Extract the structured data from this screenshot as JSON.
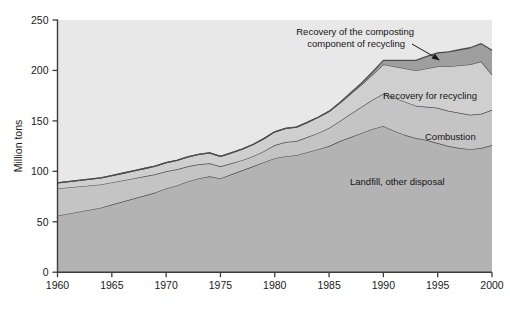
{
  "chart_data": {
    "type": "area",
    "title": "",
    "xlabel": "",
    "ylabel": "Million tons",
    "xlim": [
      1960,
      2000
    ],
    "ylim": [
      0,
      250
    ],
    "grid": false,
    "legend_position": "inline-annotations",
    "stacked": true,
    "x_ticks": [
      "1960",
      "1965",
      "1970",
      "1975",
      "1980",
      "1985",
      "1990",
      "1995",
      "2000"
    ],
    "y_ticks": [
      "0",
      "50",
      "100",
      "150",
      "200",
      "250"
    ],
    "x": [
      1960,
      1961,
      1962,
      1963,
      1964,
      1965,
      1966,
      1967,
      1968,
      1969,
      1970,
      1971,
      1972,
      1973,
      1974,
      1975,
      1976,
      1977,
      1978,
      1979,
      1980,
      1981,
      1982,
      1983,
      1984,
      1985,
      1986,
      1987,
      1988,
      1989,
      1990,
      1991,
      1992,
      1993,
      1994,
      1995,
      1996,
      1997,
      1998,
      1999,
      2000
    ],
    "series": [
      {
        "name": "Landfill, other disposal",
        "color": "#b3b3b3",
        "line_color": "#4d4d4d",
        "values": [
          56,
          58,
          60,
          62,
          64,
          67,
          70,
          73,
          76,
          79,
          83,
          86,
          90,
          93,
          95,
          93,
          97,
          101,
          105,
          109,
          113,
          115,
          116,
          119,
          122,
          125,
          130,
          134,
          138,
          142,
          145,
          140,
          136,
          133,
          131,
          128,
          125,
          123,
          122,
          123,
          126
        ]
      },
      {
        "name": "Combustion",
        "color": "#c4c4c4",
        "line_color": "#4d4d4d",
        "values": [
          27,
          26,
          25,
          24,
          23,
          22,
          21,
          20,
          19,
          18,
          17,
          16,
          15,
          14,
          13,
          12,
          11,
          10,
          10,
          11,
          13,
          14,
          14,
          15,
          16,
          18,
          20,
          23,
          26,
          29,
          32,
          33,
          33,
          32,
          33,
          35,
          35,
          35,
          34,
          34,
          35
        ]
      },
      {
        "name": "Recovery for recycling",
        "color": "#cfcfcf",
        "line_color": "#4d4d4d",
        "values": [
          5.6,
          5.8,
          6.0,
          6.3,
          6.6,
          6.8,
          7.1,
          7.4,
          7.8,
          8.2,
          8.6,
          8.9,
          9.3,
          9.8,
          10.2,
          9.9,
          10.4,
          11.0,
          11.6,
          12.4,
          13.2,
          13.6,
          13.9,
          14.6,
          15.6,
          16.4,
          17.8,
          19.8,
          22.0,
          25.0,
          29.0,
          31.0,
          33.0,
          35.0,
          38.0,
          41.0,
          44.0,
          47.0,
          50.0,
          52.0,
          35.0
        ]
      },
      {
        "name": "Recovery of the composting component of recycling",
        "color": "#9f9f9f",
        "line_color": "#4d4d4d",
        "values": [
          0,
          0,
          0,
          0,
          0,
          0,
          0,
          0,
          0,
          0,
          0,
          0,
          0,
          0,
          0,
          0,
          0,
          0,
          0,
          0,
          0,
          0,
          0,
          0,
          0,
          0,
          0.5,
          1.0,
          1.5,
          2.5,
          4.0,
          6.0,
          8.0,
          10.0,
          12.0,
          13.5,
          14.5,
          15.5,
          16.5,
          17.5,
          24.0
        ]
      }
    ],
    "totals": [
      91,
      92,
      93,
      95,
      97,
      99,
      102,
      104,
      107,
      110,
      112,
      115,
      118,
      121,
      123,
      119,
      122,
      127,
      132,
      138,
      144,
      147,
      148,
      153,
      159,
      164,
      173,
      183,
      193,
      204,
      215,
      214,
      216,
      218,
      222,
      226,
      227,
      229,
      231,
      235,
      220
    ],
    "annotations": [
      {
        "name": "composting-annotation",
        "text_line1": "Recovery of the composting",
        "text_line2": "component of recycling",
        "has_arrow": true
      },
      {
        "name": "recycling-annotation",
        "text": "Recovery for recycling",
        "has_arrow": false
      },
      {
        "name": "combustion-annotation",
        "text": "Combustion",
        "has_arrow": false
      },
      {
        "name": "landfill-annotation",
        "text": "Landfill, other disposal",
        "has_arrow": false
      }
    ],
    "colors": {
      "plot_background": "#e8e8e8",
      "axis": "#3d3d3d",
      "band_landfill": "#b3b3b3",
      "band_combustion": "#c4c4c4",
      "band_recycling": "#d2d2d2",
      "band_composting": "#a0a0a0",
      "outline": "#4d4d4d"
    }
  }
}
